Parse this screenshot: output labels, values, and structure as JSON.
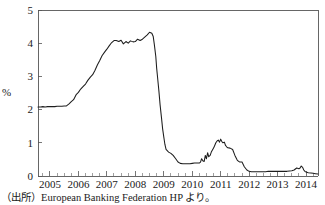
{
  "figure": {
    "unit_label": "%",
    "source_note": "（出所）European Banking Federation HP より。"
  },
  "chart_data": {
    "type": "line",
    "title": "",
    "subtitle": "",
    "xlabel": "",
    "ylabel": "%",
    "grid": false,
    "legend": "none",
    "xlim": [
      2004.58,
      2014.42
    ],
    "ylim": [
      0,
      5
    ],
    "yticks": [
      0,
      1,
      2,
      3,
      4,
      5
    ],
    "ytick_labels": [
      "0",
      "1",
      "2",
      "3",
      "4",
      "5"
    ],
    "xticks": [
      2005,
      2006,
      2007,
      2008,
      2009,
      2010,
      2011,
      2012,
      2013,
      2014
    ],
    "xtick_labels": [
      "2005",
      "2006",
      "2007",
      "2008",
      "2009",
      "2010",
      "2011",
      "2012",
      "2013",
      "2014"
    ],
    "x_minor_tick_interval": 0.25,
    "series": [
      {
        "name": "Euribor",
        "x": [
          2004.58,
          2004.67,
          2004.75,
          2004.83,
          2004.92,
          2005.0,
          2005.08,
          2005.17,
          2005.25,
          2005.33,
          2005.42,
          2005.5,
          2005.58,
          2005.67,
          2005.75,
          2005.83,
          2005.92,
          2006.0,
          2006.08,
          2006.17,
          2006.25,
          2006.33,
          2006.42,
          2006.5,
          2006.58,
          2006.67,
          2006.75,
          2006.83,
          2006.92,
          2007.0,
          2007.08,
          2007.17,
          2007.25,
          2007.33,
          2007.42,
          2007.5,
          2007.58,
          2007.67,
          2007.75,
          2007.83,
          2007.92,
          2008.0,
          2008.08,
          2008.17,
          2008.25,
          2008.33,
          2008.42,
          2008.5,
          2008.58,
          2008.63,
          2008.67,
          2008.72,
          2008.75,
          2008.79,
          2008.83,
          2008.87,
          2008.92,
          2008.96,
          2009.0,
          2009.04,
          2009.08,
          2009.17,
          2009.25,
          2009.33,
          2009.42,
          2009.5,
          2009.58,
          2009.67,
          2009.75,
          2009.83,
          2009.92,
          2010.0,
          2010.08,
          2010.17,
          2010.25,
          2010.29,
          2010.33,
          2010.38,
          2010.42,
          2010.46,
          2010.5,
          2010.54,
          2010.58,
          2010.63,
          2010.67,
          2010.71,
          2010.75,
          2010.79,
          2010.83,
          2010.88,
          2010.92,
          2010.96,
          2011.0,
          2011.04,
          2011.08,
          2011.13,
          2011.17,
          2011.21,
          2011.25,
          2011.33,
          2011.42,
          2011.5,
          2011.58,
          2011.63,
          2011.67,
          2011.75,
          2011.83,
          2011.92,
          2012.0,
          2012.08,
          2012.17,
          2012.25,
          2012.33,
          2012.42,
          2012.5,
          2012.58,
          2012.67,
          2012.75,
          2012.83,
          2012.92,
          2013.0,
          2013.08,
          2013.17,
          2013.25,
          2013.33,
          2013.42,
          2013.5,
          2013.58,
          2013.67,
          2013.75,
          2013.79,
          2013.83,
          2013.88,
          2013.92,
          2013.96,
          2014.0,
          2014.08,
          2014.17,
          2014.25,
          2014.33,
          2014.42
        ],
        "y": [
          2.08,
          2.08,
          2.09,
          2.08,
          2.09,
          2.09,
          2.09,
          2.09,
          2.1,
          2.1,
          2.1,
          2.11,
          2.11,
          2.17,
          2.24,
          2.3,
          2.45,
          2.52,
          2.62,
          2.7,
          2.77,
          2.88,
          2.98,
          3.05,
          3.18,
          3.35,
          3.48,
          3.62,
          3.73,
          3.82,
          3.92,
          4.02,
          4.08,
          4.08,
          4.05,
          4.09,
          3.98,
          4.05,
          4.0,
          4.07,
          4.04,
          4.05,
          4.12,
          4.08,
          4.12,
          4.18,
          4.25,
          4.33,
          4.3,
          4.2,
          3.95,
          3.6,
          3.25,
          2.9,
          2.55,
          2.15,
          1.75,
          1.42,
          1.18,
          0.95,
          0.8,
          0.72,
          0.68,
          0.62,
          0.52,
          0.42,
          0.38,
          0.37,
          0.37,
          0.37,
          0.37,
          0.38,
          0.39,
          0.39,
          0.39,
          0.42,
          0.52,
          0.45,
          0.44,
          0.62,
          0.52,
          0.7,
          0.58,
          0.62,
          0.72,
          0.78,
          0.84,
          0.92,
          1.0,
          1.06,
          1.08,
          1.02,
          1.11,
          1.04,
          1.0,
          1.02,
          0.92,
          0.88,
          0.85,
          0.84,
          0.8,
          0.62,
          0.48,
          0.44,
          0.42,
          0.42,
          0.28,
          0.18,
          0.14,
          0.13,
          0.13,
          0.13,
          0.13,
          0.13,
          0.13,
          0.13,
          0.14,
          0.14,
          0.14,
          0.14,
          0.14,
          0.14,
          0.14,
          0.14,
          0.14,
          0.15,
          0.16,
          0.18,
          0.24,
          0.22,
          0.24,
          0.3,
          0.26,
          0.18,
          0.14,
          0.12,
          0.1,
          0.09,
          0.08,
          0.07,
          0.06
        ]
      }
    ]
  }
}
